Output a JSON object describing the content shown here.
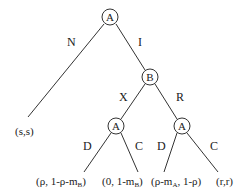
{
  "diagram": {
    "type": "game-tree",
    "nodes": [
      {
        "id": "root",
        "player": "A"
      },
      {
        "id": "b",
        "player": "B"
      },
      {
        "id": "a-left",
        "player": "A"
      },
      {
        "id": "a-right",
        "player": "A"
      }
    ],
    "edges": [
      {
        "from": "root",
        "to": "leaf-ss",
        "label": "N"
      },
      {
        "from": "root",
        "to": "b",
        "label": "I"
      },
      {
        "from": "b",
        "to": "a-left",
        "label": "X"
      },
      {
        "from": "b",
        "to": "a-right",
        "label": "R"
      },
      {
        "from": "a-left",
        "to": "leaf-1",
        "label": "D"
      },
      {
        "from": "a-left",
        "to": "leaf-2",
        "label": "C"
      },
      {
        "from": "a-right",
        "to": "leaf-3",
        "label": "D"
      },
      {
        "from": "a-right",
        "to": "leaf-4",
        "label": "C"
      }
    ],
    "payoffs": {
      "leaf_ss": "(s,s)",
      "leaf_1": {
        "pre": "(ρ, 1-ρ-m",
        "sub": "B",
        "post": ")"
      },
      "leaf_2": {
        "pre": "(0, 1-m",
        "sub": "B",
        "post": ")"
      },
      "leaf_3": {
        "pre": "(ρ-m",
        "sub": "A",
        "post": ", 1-ρ)"
      },
      "leaf_4": "(r,r)"
    }
  }
}
